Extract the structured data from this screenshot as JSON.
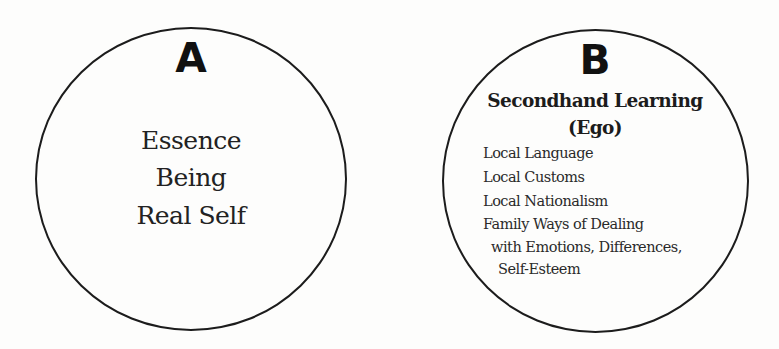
{
  "diagram": {
    "circles": [
      {
        "id": "A",
        "label": "A",
        "lines": [
          "Essence",
          "Being",
          "Real Self"
        ]
      },
      {
        "id": "B",
        "label": "B",
        "title": "Secondhand Learning",
        "subtitle": "(Ego)",
        "items": [
          "Local Language",
          "Local Customs",
          "Local Nationalism",
          "Family Ways of Dealing",
          "with Emotions, Differences,",
          "Self-Esteem"
        ]
      }
    ],
    "colors": {
      "stroke": "#1c1c1c",
      "text": "#222222",
      "background": "#fdfdfc"
    }
  }
}
